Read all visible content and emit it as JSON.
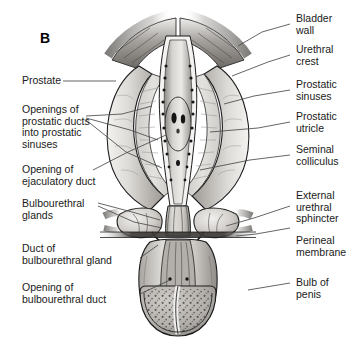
{
  "figure": {
    "panel_letter": "B"
  },
  "labels_left": [
    {
      "id": "prostate",
      "text": "Prostate"
    },
    {
      "id": "openings-prostatic-ducts",
      "text": "Openings of\nprostatic ducts\ninto prostatic\nsinuses"
    },
    {
      "id": "opening-ejaculatory-duct",
      "text": "Opening of\nejaculatory duct"
    },
    {
      "id": "bulbourethral-glands",
      "text": "Bulbourethral\nglands"
    },
    {
      "id": "duct-bulbourethral-gland",
      "text": "Duct of\nbulbourethral gland"
    },
    {
      "id": "opening-bulbourethral-duct",
      "text": "Opening of\nbulbourethral duct"
    }
  ],
  "labels_right": [
    {
      "id": "bladder-wall",
      "text": "Bladder\nwall"
    },
    {
      "id": "urethral-crest",
      "text": "Urethral\ncrest"
    },
    {
      "id": "prostatic-sinuses",
      "text": "Prostatic\nsinuses"
    },
    {
      "id": "prostatic-utricle",
      "text": "Prostatic\nutricle"
    },
    {
      "id": "seminal-colliculus",
      "text": "Seminal\ncolliculus"
    },
    {
      "id": "external-urethral-sphincter",
      "text": "External\nurethral\nsphincter"
    },
    {
      "id": "perineal-membrane",
      "text": "Perineal\nmembrane"
    },
    {
      "id": "bulb-of-penis",
      "text": "Bulb of\npenis"
    }
  ],
  "colors": {
    "background": "#ffffff",
    "text": "#1a1a1a",
    "leader_line": "#4a4a4a",
    "outline": "#1c1c1c",
    "prostate_light": "#e8e6e3",
    "prostate_mid": "#c9c6c2",
    "prostate_dark": "#9a9793",
    "lumen": "#f2f1ef",
    "urethra_crest": "#b9b6b2",
    "bladder_wall": "#8d8a86",
    "gland": "#d9d7d3",
    "bulb_spongy": "#b5b2ae",
    "membrane_dark": "#3a3a3a"
  }
}
